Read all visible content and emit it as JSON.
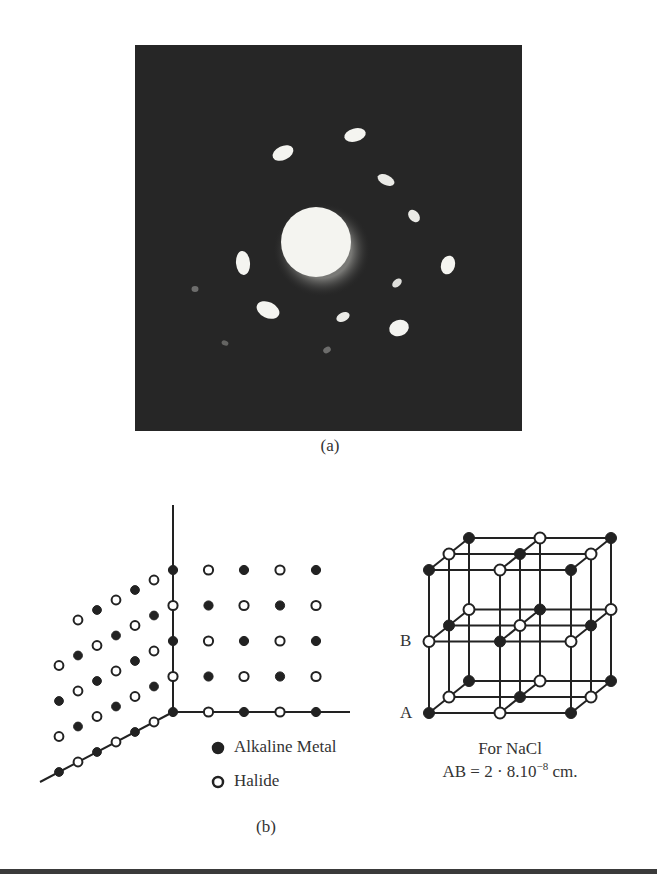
{
  "figure_a": {
    "caption": "(a)",
    "description": "Electron diffraction pattern",
    "background_color": "#262626",
    "spot_color": "#f4f4f0",
    "central_spot": {
      "cx": 316,
      "cy": 242,
      "r": 35
    },
    "spots": [
      {
        "cx": 283,
        "cy": 153,
        "rx": 11,
        "ry": 7,
        "rot": -25,
        "opacity": 1
      },
      {
        "cx": 355,
        "cy": 135,
        "rx": 11,
        "ry": 6.5,
        "rot": -15,
        "opacity": 1
      },
      {
        "cx": 386,
        "cy": 180,
        "rx": 9,
        "ry": 5,
        "rot": 25,
        "opacity": 0.95
      },
      {
        "cx": 414,
        "cy": 216,
        "rx": 7,
        "ry": 5,
        "rot": 50,
        "opacity": 0.95
      },
      {
        "cx": 448,
        "cy": 265,
        "rx": 7,
        "ry": 9.5,
        "rot": 15,
        "opacity": 1
      },
      {
        "cx": 397,
        "cy": 283,
        "rx": 5.5,
        "ry": 3.5,
        "rot": -40,
        "opacity": 0.9
      },
      {
        "cx": 399,
        "cy": 328,
        "rx": 10,
        "ry": 8,
        "rot": -20,
        "opacity": 1
      },
      {
        "cx": 343,
        "cy": 317,
        "rx": 7,
        "ry": 4.5,
        "rot": -25,
        "opacity": 0.95
      },
      {
        "cx": 268,
        "cy": 310,
        "rx": 12,
        "ry": 8,
        "rot": 25,
        "opacity": 1
      },
      {
        "cx": 243,
        "cy": 263,
        "rx": 7,
        "ry": 12,
        "rot": -5,
        "opacity": 1
      },
      {
        "cx": 195,
        "cy": 289,
        "rx": 3.5,
        "ry": 3,
        "rot": 0,
        "opacity": 0.35
      },
      {
        "cx": 225,
        "cy": 343,
        "rx": 3.5,
        "ry": 2.5,
        "rot": 20,
        "opacity": 0.3
      },
      {
        "cx": 327,
        "cy": 350,
        "rx": 4,
        "ry": 3,
        "rot": -30,
        "opacity": 0.35
      }
    ]
  },
  "figure_b": {
    "caption": "(b)",
    "legend": [
      {
        "symbol": "filled-circle",
        "label": "Alkaline Metal"
      },
      {
        "symbol": "open-circle",
        "label": "Halide"
      }
    ],
    "cube": {
      "label_a": "A",
      "label_b": "B",
      "note_line1": "For NaCl",
      "note_line2_prefix": "AB = 2 · 8.10",
      "note_line2_exponent": "−8",
      "note_line2_suffix": " cm."
    }
  },
  "colors": {
    "ink": "#222222",
    "rule": "#3a3a3a",
    "page": "#ffffff"
  }
}
